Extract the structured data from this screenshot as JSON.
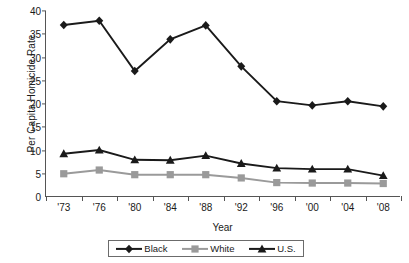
{
  "chart_data": {
    "type": "line",
    "title": "",
    "xlabel": "Year",
    "ylabel": "Per Capita Homicide Rate",
    "categories": [
      "'73",
      "'76",
      "'80",
      "'84",
      "'88",
      "'92",
      "'96",
      "'00",
      "'04",
      "'08"
    ],
    "ylim": [
      0,
      40
    ],
    "yticks": [
      0,
      5,
      10,
      15,
      20,
      25,
      30,
      35,
      40
    ],
    "grid": false,
    "legend_position": "bottom",
    "series": [
      {
        "name": "Black",
        "marker": "diamond",
        "color": "#1a1a1a",
        "values": [
          37.0,
          37.9,
          27.1,
          33.9,
          36.9,
          28.1,
          20.6,
          19.7,
          20.6,
          19.5
        ]
      },
      {
        "name": "White",
        "marker": "square",
        "color": "#9a9a9a",
        "values": [
          5.0,
          5.8,
          4.8,
          4.8,
          4.8,
          4.1,
          3.1,
          3.0,
          3.0,
          2.9
        ]
      },
      {
        "name": "U.S.",
        "marker": "triangle",
        "color": "#1a1a1a",
        "values": [
          9.3,
          10.1,
          8.0,
          7.9,
          8.9,
          7.2,
          6.2,
          6.0,
          6.0,
          4.6
        ]
      }
    ]
  },
  "legend": {
    "items": [
      {
        "label": "Black"
      },
      {
        "label": "White"
      },
      {
        "label": "U.S."
      }
    ]
  },
  "axes": {
    "y_title": "Per Capita Homicide Rate",
    "x_title": "Year"
  }
}
